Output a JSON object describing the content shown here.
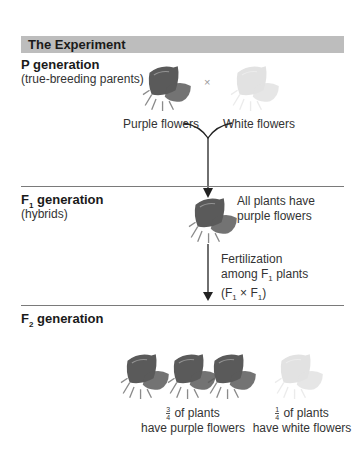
{
  "header": {
    "title": "The Experiment"
  },
  "p_generation": {
    "title": "P generation",
    "subtitle": "(true-breeding parents)",
    "cross_symbol": "×",
    "left_label": "Purple flowers",
    "right_label": "White flowers"
  },
  "f1_generation": {
    "title_main": "F",
    "title_sub": "1",
    "title_rest": " generation",
    "subtitle": "(hybrids)",
    "result_line1": "All plants have",
    "result_line2": "purple flowers",
    "fert_line1": "Fertilization",
    "fert_line2_a": "among F",
    "fert_line2_sub": "1",
    "fert_line2_b": " plants",
    "fert_line3_a": "(F",
    "fert_line3_sub1": "1",
    "fert_line3_mid": " × F",
    "fert_line3_sub2": "1",
    "fert_line3_b": ")"
  },
  "f2_generation": {
    "title_main": "F",
    "title_sub": "2",
    "title_rest": " generation",
    "purple_frac_num": "3",
    "purple_frac_den": "4",
    "purple_line1": " of plants",
    "purple_line2": "have purple flowers",
    "white_frac_num": "1",
    "white_frac_den": "4",
    "white_line1": " of plants",
    "white_line2": "have white flowers"
  },
  "colors": {
    "header_bg": "#bdbdbd",
    "purple_flower": "#5a5a5a",
    "white_flower": "#e6e6e6",
    "divider": "#7a7a7a"
  }
}
